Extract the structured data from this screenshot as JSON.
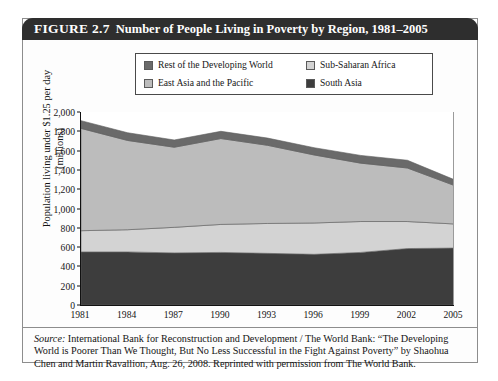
{
  "figure": {
    "number": "FIGURE 2.7",
    "title": "Number of People Living in Poverty by Region, 1981–2005"
  },
  "source": {
    "label": "Source:",
    "text": " International Bank for Reconstruction and Development / The World Bank: “The Developing World is Poorer Than We Thought, But No Less Successful in the Fight Against Poverty” by Shaohua Chen and Martin Ravallion, Aug. 26, 2008.  Reprinted with permission from The World Bank."
  },
  "chart_data": {
    "type": "area",
    "stacked": true,
    "title": "Number of People Living in Poverty by Region, 1981–2005",
    "xlabel": "",
    "ylabel": "Population living under $1.25 per day (millions)",
    "ylabel_line1": "Population living under $1.25 per day",
    "ylabel_line2": "(millions)",
    "x": [
      1981,
      1984,
      1987,
      1990,
      1993,
      1996,
      1999,
      2002,
      2005
    ],
    "xtick_labels": [
      "1981",
      "1984",
      "1987",
      "1990",
      "1993",
      "1996",
      "1999",
      "2002",
      "2005"
    ],
    "ytick_labels": [
      "0",
      "200",
      "400",
      "600",
      "800",
      "1,000",
      "1,200",
      "1,400",
      "1,600",
      "1,800",
      "2,000"
    ],
    "ytick_values": [
      0,
      200,
      400,
      600,
      800,
      1000,
      1200,
      1400,
      1600,
      1800,
      2000
    ],
    "ylim": [
      0,
      2000
    ],
    "grid": false,
    "legend_position": "top-center",
    "series": [
      {
        "name": "South Asia",
        "color": "#3d3d3d",
        "stack_order": 1,
        "values": [
          550,
          550,
          540,
          545,
          535,
          525,
          545,
          585,
          590
        ]
      },
      {
        "name": "Sub-Saharan Africa",
        "color": "#d3d3d3",
        "stack_order": 2,
        "values": [
          220,
          230,
          265,
          290,
          310,
          325,
          320,
          280,
          250
        ]
      },
      {
        "name": "East Asia and the Pacific",
        "color": "#bcbcbc",
        "stack_order": 3,
        "values": [
          1060,
          925,
          830,
          890,
          810,
          705,
          605,
          555,
          400
        ]
      },
      {
        "name": "Rest of the Developing World",
        "color": "#6a6a6a",
        "stack_order": 4,
        "values": [
          80,
          80,
          75,
          75,
          75,
          75,
          80,
          80,
          60
        ]
      }
    ],
    "cumulative_tops": {
      "south_asia": [
        550,
        550,
        540,
        545,
        535,
        525,
        545,
        585,
        590
      ],
      "sub_saharan": [
        770,
        780,
        805,
        835,
        845,
        850,
        865,
        865,
        840
      ],
      "east_asia": [
        1830,
        1705,
        1635,
        1725,
        1655,
        1555,
        1470,
        1420,
        1240
      ],
      "total": [
        1910,
        1785,
        1710,
        1800,
        1730,
        1630,
        1550,
        1500,
        1300
      ]
    }
  },
  "legend": {
    "items": [
      {
        "label": "Rest of the Developing World",
        "color": "#6a6a6a"
      },
      {
        "label": "Sub-Saharan Africa",
        "color": "#d3d3d3"
      },
      {
        "label": "East Asia and the Pacific",
        "color": "#bcbcbc"
      },
      {
        "label": "South Asia",
        "color": "#3d3d3d"
      }
    ]
  }
}
